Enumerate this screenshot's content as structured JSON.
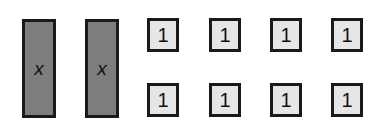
{
  "diagram": {
    "x_tiles": [
      {
        "label": "x",
        "left": 22
      },
      {
        "label": "x",
        "left": 85
      }
    ],
    "unit_tiles": [
      {
        "label": "1",
        "left": 147,
        "top": 18
      },
      {
        "label": "1",
        "left": 209,
        "top": 18
      },
      {
        "label": "1",
        "left": 270,
        "top": 18
      },
      {
        "label": "1",
        "left": 331,
        "top": 18
      },
      {
        "label": "1",
        "left": 147,
        "top": 83
      },
      {
        "label": "1",
        "left": 209,
        "top": 83
      },
      {
        "label": "1",
        "left": 270,
        "top": 83
      },
      {
        "label": "1",
        "left": 331,
        "top": 83
      }
    ],
    "colors": {
      "x_tile_fill": "#7d7d7d",
      "unit_tile_fill": "#e6e6e6",
      "border": "#1a1a1a"
    }
  }
}
